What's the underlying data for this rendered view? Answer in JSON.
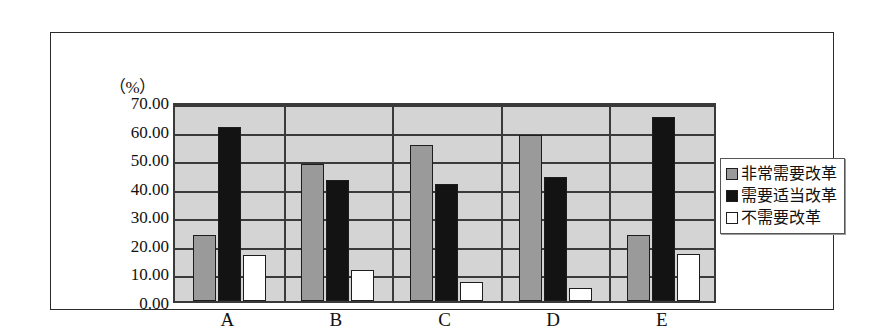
{
  "chart_data": {
    "type": "bar",
    "title": "",
    "xlabel": "",
    "ylabel": "",
    "unit_label": "（%）",
    "categories": [
      "A",
      "B",
      "C",
      "D",
      "E"
    ],
    "series": [
      {
        "name": "非常需要改革",
        "color": "#9a9a9a",
        "values": [
          23.0,
          48.0,
          54.5,
          58.0,
          23.0
        ]
      },
      {
        "name": "需要适当改革",
        "color": "#131313",
        "values": [
          61.0,
          42.5,
          41.0,
          43.5,
          64.5
        ]
      },
      {
        "name": "不需要改革",
        "color": "#ffffff",
        "values": [
          16.0,
          11.0,
          6.5,
          4.5,
          16.5
        ]
      }
    ],
    "ylim": [
      0,
      70
    ],
    "ytick_step": 10,
    "ytick_labels": [
      "70.00",
      "60.00",
      "50.00",
      "40.00",
      "30.00",
      "20.00",
      "10.00",
      "0.00"
    ],
    "ytick_values": [
      70,
      60,
      50,
      40,
      30,
      20,
      10,
      0
    ],
    "grid": true,
    "legend_position": "right",
    "plot_background": "#d4d4d4",
    "gridline_color": "#3a3a3a"
  }
}
